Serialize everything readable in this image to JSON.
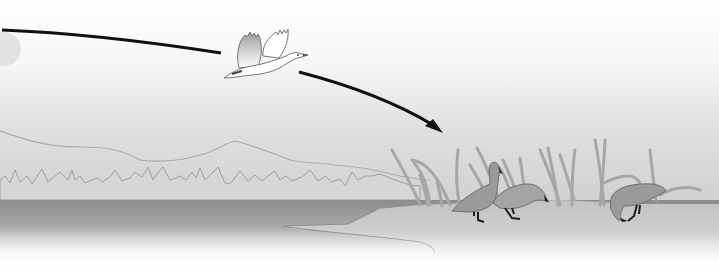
{
  "diagram": {
    "title": "",
    "colors": {
      "sky_top": "#ffffff",
      "sky_bottom": "#d4d4d4",
      "mountain_line": "#a8a8a8",
      "treeline": "#b4b4b4",
      "treeline_stroke": "#9c9c9c",
      "water_top": "#8e8e8e",
      "water_bottom": "#ffffff",
      "shore": "#bdbdbd",
      "shore_edge": "#8a8a8a",
      "reeds": "#a6a6a6",
      "goose_body": "#9a9a9a",
      "goose_outline": "#6e6e6e",
      "goose_feet": "#1e1e1e",
      "flying_goose_fill": "#ffffff",
      "flying_goose_wing_shade": "#bcbcbc",
      "path_line": "#111111"
    },
    "elements": {
      "flight_path": {
        "name": "migration-path-arrow",
        "segments": 2,
        "has_arrowhead": true
      },
      "flying_goose": {
        "name": "flying-goose",
        "direction": "right"
      },
      "ground_geese": [
        {
          "name": "goose-standing-head-up"
        },
        {
          "name": "goose-walking-head-down"
        },
        {
          "name": "goose-feeding"
        }
      ],
      "background": [
        "sun-partial",
        "mountain-ridge",
        "treeline",
        "lake",
        "shore",
        "reeds"
      ]
    }
  }
}
